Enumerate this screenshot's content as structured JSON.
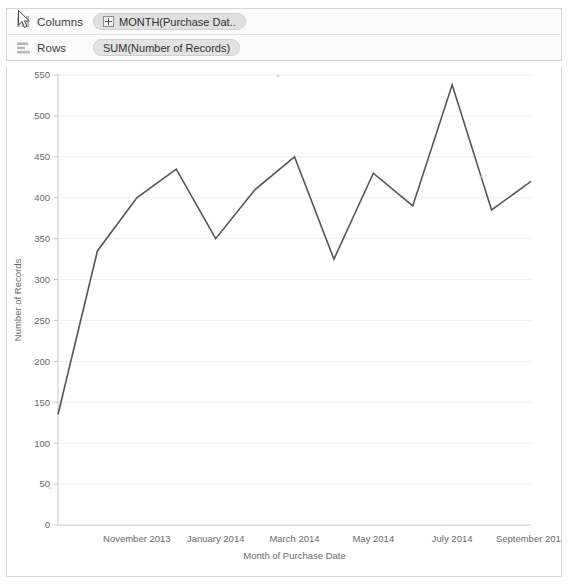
{
  "window": {
    "title": "Tableau Worksheet",
    "cursor_icon": "mouse-pointer-icon"
  },
  "shelves": [
    {
      "name": "columns",
      "label": "Columns",
      "icon": "columns-shelf-icon",
      "pill": {
        "text": "MONTH(Purchase Dat..",
        "expand_icon": "plus-box-icon",
        "type": "date-dimension"
      }
    },
    {
      "name": "rows",
      "label": "Rows",
      "icon": "rows-shelf-icon",
      "pill": {
        "text": "SUM(Number of Records)",
        "type": "measure"
      }
    }
  ],
  "chart_data": {
    "type": "line",
    "title": "",
    "subtitle": "",
    "xlabel": "Month of Purchase Date",
    "ylabel": "Number of Records",
    "x": [
      "September 2013",
      "October 2013",
      "November 2013",
      "December 2013",
      "January 2014",
      "February 2014",
      "March 2014",
      "April 2014",
      "May 2014",
      "June 2014",
      "July 2014",
      "August 2014",
      "September 2014"
    ],
    "values": [
      135,
      335,
      400,
      435,
      350,
      410,
      450,
      325,
      430,
      390,
      538,
      385,
      420
    ],
    "series": [
      {
        "name": "SUM(Number of Records)",
        "values": [
          135,
          335,
          400,
          435,
          350,
          410,
          450,
          325,
          430,
          390,
          538,
          385,
          420
        ]
      }
    ],
    "x_tick_labels": [
      "November 2013",
      "January 2014",
      "March 2014",
      "May 2014",
      "July 2014",
      "September 2014"
    ],
    "x_tick_values": [
      "November 2013",
      "January 2014",
      "March 2014",
      "May 2014",
      "July 2014",
      "September 2014"
    ],
    "y_tick_labels": [
      "0",
      "50",
      "100",
      "150",
      "200",
      "250",
      "300",
      "350",
      "400",
      "450",
      "500",
      "550"
    ],
    "y_ticks": [
      0,
      50,
      100,
      150,
      200,
      250,
      300,
      350,
      400,
      450,
      500,
      550
    ],
    "ylim": [
      0,
      550
    ],
    "grid": true,
    "grid_axis": "y",
    "legend": false,
    "legend_position": "none",
    "line_color": "#555555",
    "grid_color": "#efefef",
    "axis_color": "#c8c8c8",
    "tick_text_color": "#6a6a6a"
  },
  "colors": {
    "panel_border": "#d6d6d6",
    "shelf_background": "#fbfbfb",
    "pill_background": "#e3e3e3",
    "text": "#333333"
  }
}
